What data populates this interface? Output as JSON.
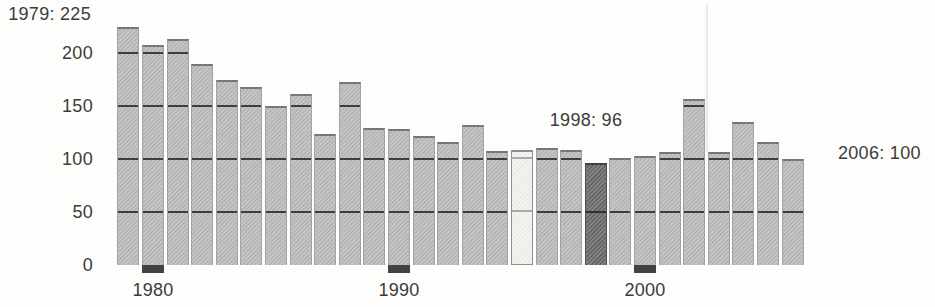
{
  "chart_data": {
    "type": "bar",
    "title": "",
    "xlabel": "",
    "ylabel": "",
    "x": [
      1979,
      1980,
      1981,
      1982,
      1983,
      1984,
      1985,
      1986,
      1987,
      1988,
      1989,
      1990,
      1991,
      1992,
      1993,
      1994,
      1995,
      1996,
      1997,
      1998,
      1999,
      2000,
      2001,
      2002,
      2003,
      2004,
      2005,
      2006
    ],
    "values": [
      225,
      208,
      213,
      190,
      175,
      168,
      150,
      161,
      124,
      173,
      129,
      128,
      122,
      116,
      132,
      108,
      109,
      110,
      109,
      96,
      101,
      103,
      107,
      157,
      107,
      135,
      116,
      100
    ],
    "ylim": [
      0,
      240
    ],
    "yticks": [
      0,
      50,
      100,
      150,
      200
    ],
    "ytick_labels": [
      "0",
      "50",
      "100",
      "150",
      "200"
    ],
    "xtick_years": [
      1980,
      1990,
      2000
    ],
    "xtick_labels": [
      "1980",
      "1990",
      "2000"
    ],
    "grid": "dark horizontal rules drawn only across bars at 50/100/150/200",
    "legend": "none",
    "highlighted_bars": {
      "light": 1995,
      "dark": 1998
    },
    "annotations": [
      {
        "text": "1979: 225",
        "year": 1979,
        "value": 225,
        "position": "top-left"
      },
      {
        "text": "1998: 96",
        "year": 1998,
        "value": 96,
        "position": "above-bar"
      },
      {
        "text": "2006: 100",
        "year": 2006,
        "value": 100,
        "position": "right-of-bar"
      }
    ]
  },
  "colors": {
    "background": "#fdfdfc",
    "bar_fill": "#b9b9b9",
    "bar_fill_light": "#f2f2ef",
    "bar_fill_dark": "#676767",
    "gridline_on_bar": "#3e3e3e",
    "gridline_on_light_bar": "#a9a9a9",
    "gridline_on_dark_bar": "#2f2f2f",
    "axis_tick": "#424242",
    "text": "#3b3b3b"
  }
}
